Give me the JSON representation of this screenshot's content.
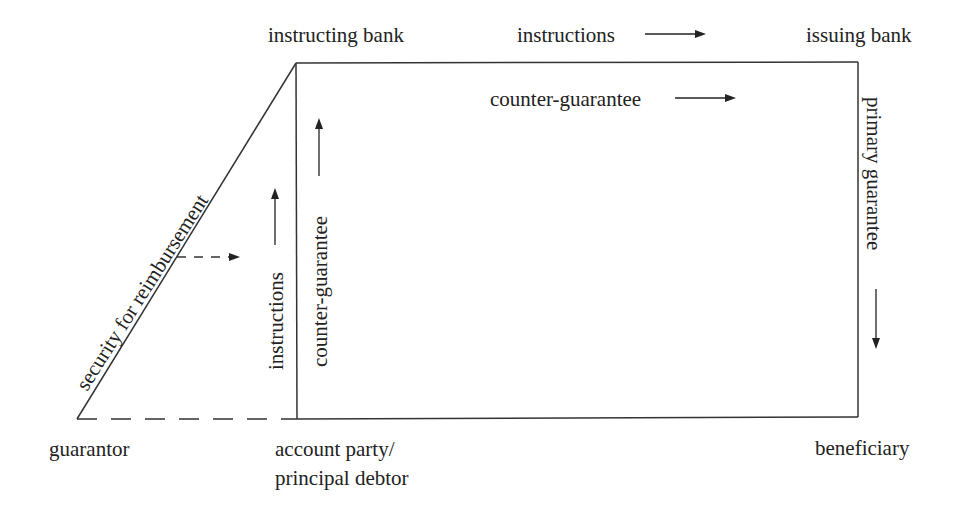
{
  "diagram": {
    "type": "flow-diagram",
    "nodes": {
      "instructing_bank": "instructing bank",
      "issuing_bank": "issuing bank",
      "guarantor": "guarantor",
      "account_party_line1": "account party/",
      "account_party_line2": "principal debtor",
      "beneficiary": "beneficiary"
    },
    "edges": {
      "top_instructions": "instructions",
      "top_counter_guarantee": "counter-guarantee",
      "diagonal_security": "security for reimbursement",
      "left_instructions": "instructions",
      "left_counter_guarantee": "counter-guarantee",
      "right_primary_guarantee": "primary guarantee"
    },
    "colors": {
      "line": "#333333",
      "text": "#222222",
      "background": "#ffffff"
    }
  }
}
